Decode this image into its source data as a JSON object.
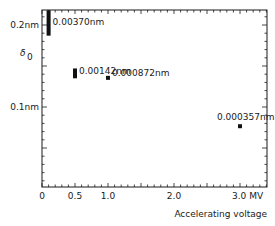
{
  "chart_data": {
    "type": "scatter",
    "title": "",
    "xlabel": "Accelerating voltage",
    "ylabel": "δ₀",
    "x_unit": "MV",
    "y_unit": "nm",
    "xlim": [
      0,
      3.4
    ],
    "ylim": [
      0,
      0.218
    ],
    "x_ticks": [
      {
        "value": 0,
        "label": "0"
      },
      {
        "value": 0.5,
        "label": "0.5"
      },
      {
        "value": 1.0,
        "label": "1.0"
      },
      {
        "value": 2.0,
        "label": "2.0"
      },
      {
        "value": 3.0,
        "label": "3.0 MV"
      }
    ],
    "y_ticks": [
      {
        "value": 0.2,
        "label": "0.2nm"
      },
      {
        "value": 0.1,
        "label": "0.1nm"
      }
    ],
    "grid": false,
    "points": [
      {
        "x": 0.1,
        "y_low": 0.187,
        "y_high": 0.218,
        "label": "0.00370nm"
      },
      {
        "x": 0.5,
        "y_low": 0.135,
        "y_high": 0.147,
        "label": "0.00142nm"
      },
      {
        "x": 1.0,
        "y_low": 0.134,
        "y_high": 0.138,
        "label": "0.000872nm"
      },
      {
        "x": 3.0,
        "y_low": 0.075,
        "y_high": 0.079,
        "label": "0.000357nm"
      }
    ]
  }
}
